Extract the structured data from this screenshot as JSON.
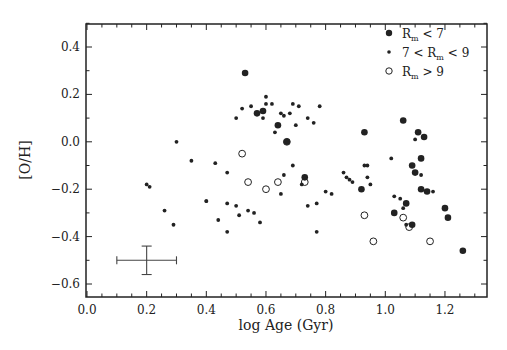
{
  "chart_data": {
    "type": "scatter",
    "title": "",
    "xlabel": "log Age (Gyr)",
    "ylabel": "[O/H]",
    "xlim": [
      0.0,
      1.35
    ],
    "ylim": [
      -0.65,
      0.52
    ],
    "xticks": [
      "0.0",
      "0.2",
      "0.4",
      "0.6",
      "0.8",
      "1.0",
      "1.2"
    ],
    "yticks": [
      "0.4",
      "0.2",
      "0.0",
      "-0.2",
      "-0.4",
      "-0.6"
    ],
    "grid": false,
    "legend_position": "upper right",
    "legend": [
      {
        "label": "R_m < 7",
        "marker": "large-filled"
      },
      {
        "label": "7 < R_m < 9",
        "marker": "small-filled"
      },
      {
        "label": "R_m > 9",
        "marker": "open-circle"
      }
    ],
    "error_bar": {
      "x": 0.2,
      "y": -0.5,
      "xerr": 0.1,
      "yerr": 0.06
    },
    "series": [
      {
        "name": "R_m < 7",
        "points": [
          [
            0.53,
            0.29
          ],
          [
            0.57,
            0.12
          ],
          [
            0.59,
            0.13
          ],
          [
            0.64,
            0.07
          ],
          [
            0.67,
            0.0
          ],
          [
            0.73,
            -0.15
          ],
          [
            0.93,
            0.04
          ],
          [
            1.06,
            0.09
          ],
          [
            1.11,
            0.04
          ],
          [
            1.13,
            0.02
          ],
          [
            0.92,
            -0.2
          ],
          [
            1.09,
            -0.1
          ],
          [
            1.1,
            -0.13
          ],
          [
            1.12,
            -0.07
          ],
          [
            1.12,
            -0.2
          ],
          [
            1.14,
            -0.21
          ],
          [
            1.07,
            -0.26
          ],
          [
            1.03,
            -0.3
          ],
          [
            1.09,
            -0.35
          ],
          [
            1.2,
            -0.28
          ],
          [
            1.21,
            -0.32
          ],
          [
            1.26,
            -0.46
          ]
        ]
      },
      {
        "name": "7 < R_m < 9",
        "points": [
          [
            0.2,
            -0.18
          ],
          [
            0.21,
            -0.19
          ],
          [
            0.26,
            -0.29
          ],
          [
            0.3,
            0.0
          ],
          [
            0.29,
            -0.35
          ],
          [
            0.35,
            -0.08
          ],
          [
            0.4,
            -0.25
          ],
          [
            0.4,
            -0.25
          ],
          [
            0.43,
            -0.09
          ],
          [
            0.44,
            -0.33
          ],
          [
            0.47,
            -0.13
          ],
          [
            0.47,
            -0.26
          ],
          [
            0.5,
            -0.27
          ],
          [
            0.51,
            -0.31
          ],
          [
            0.5,
            0.1
          ],
          [
            0.52,
            0.14
          ],
          [
            0.55,
            0.15
          ],
          [
            0.59,
            0.1
          ],
          [
            0.6,
            0.19
          ],
          [
            0.63,
            0.04
          ],
          [
            0.6,
            0.16
          ],
          [
            0.62,
            0.16
          ],
          [
            0.65,
            0.12
          ],
          [
            0.66,
            0.11
          ],
          [
            0.68,
            0.12
          ],
          [
            0.69,
            0.16
          ],
          [
            0.71,
            0.15
          ],
          [
            0.7,
            0.07
          ],
          [
            0.74,
            0.1
          ],
          [
            0.78,
            0.15
          ],
          [
            0.76,
            0.08
          ],
          [
            0.69,
            -0.1
          ],
          [
            0.66,
            -0.14
          ],
          [
            0.72,
            -0.18
          ],
          [
            0.77,
            -0.26
          ],
          [
            0.77,
            -0.38
          ],
          [
            0.82,
            -0.22
          ],
          [
            0.86,
            -0.13
          ],
          [
            0.87,
            -0.15
          ],
          [
            0.88,
            -0.16
          ],
          [
            0.89,
            -0.17
          ],
          [
            0.54,
            -0.29
          ],
          [
            0.47,
            -0.38
          ],
          [
            0.56,
            -0.3
          ],
          [
            0.58,
            -0.34
          ],
          [
            0.65,
            -0.22
          ],
          [
            0.74,
            -0.27
          ],
          [
            0.8,
            -0.21
          ],
          [
            0.93,
            -0.1
          ],
          [
            0.94,
            -0.1
          ],
          [
            0.94,
            -0.15
          ],
          [
            0.95,
            -0.18
          ],
          [
            1.02,
            -0.07
          ],
          [
            1.03,
            -0.23
          ],
          [
            1.05,
            -0.24
          ],
          [
            1.06,
            -0.28
          ],
          [
            1.1,
            0.01
          ],
          [
            1.12,
            -0.14
          ],
          [
            1.16,
            -0.21
          ],
          [
            1.07,
            -0.35
          ]
        ]
      },
      {
        "name": "R_m > 9",
        "points": [
          [
            0.52,
            -0.05
          ],
          [
            0.54,
            -0.17
          ],
          [
            0.6,
            -0.2
          ],
          [
            0.64,
            -0.17
          ],
          [
            0.67,
            0.0
          ],
          [
            0.73,
            -0.17
          ],
          [
            0.93,
            -0.31
          ],
          [
            0.96,
            -0.42
          ],
          [
            1.06,
            -0.32
          ],
          [
            1.08,
            -0.36
          ],
          [
            1.15,
            -0.42
          ]
        ]
      }
    ]
  }
}
